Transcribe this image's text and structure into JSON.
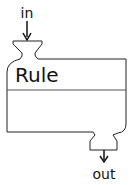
{
  "diagram": {
    "block": {
      "title": "Rule",
      "stroke_color": "#222222",
      "fill_color": "#ffffff"
    },
    "input_port": {
      "label": "in",
      "icon": "arrow-down-icon"
    },
    "output_port": {
      "label": "out",
      "icon": "arrow-down-icon"
    }
  }
}
